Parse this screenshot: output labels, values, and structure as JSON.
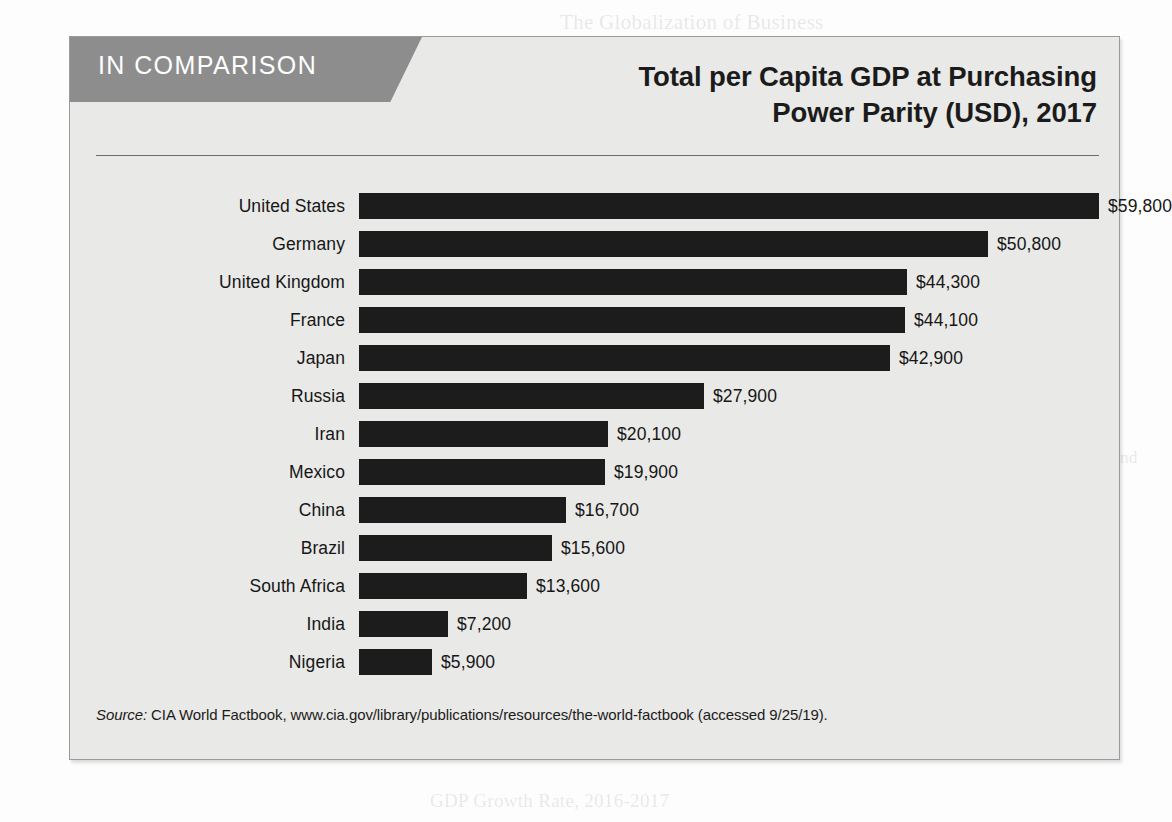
{
  "banner": {
    "label": "IN COMPARISON"
  },
  "title": {
    "line1": "Total per Capita GDP at Purchasing",
    "line2": "Power Parity (USD), 2017"
  },
  "source": {
    "prefix": "Source:",
    "text": "CIA World Factbook, www.cia.gov/library/publications/resources/the-world-factbook (accessed 9/25/19)."
  },
  "colors": {
    "panel_background": "#e9e9e7",
    "panel_border": "#9b9b9b",
    "banner": "#8d8d8d",
    "bar": "#1c1c1c",
    "text": "#161616",
    "rule": "#6d6d6d"
  },
  "bleed_text": {
    "top_right": "The Globalization of Business",
    "line_a": "determined solely by domestic factors. Politics, regulations,",
    "line_b": "and technologies all play a role in the shape of business",
    "line_c": "worldwide. Global business is affected by competing forces",
    "line_d": "that push toward greater integration as well as those that",
    "line_e": "resist it. Companies must be able to recognize and navigate",
    "line_f": "these shifting currents to succeed in international markets.",
    "line_g": "It is not easy to predict the future direction of the global economy",
    "line_h": "and currents of trade. Some observers argue that the recent upturn in",
    "line_i": "the anti-globalist or globalist politics in many countries, includes the",
    "line_j": "example of the United States, may not impede the relentless pace of",
    "line_k": "globalization supported by the growth of digital technologies, rising",
    "line_l": "trade agreements such as the promoted by the World Trade Organization and",
    "line_m": "because of the need to remain competitive.",
    "footer": "GDP Growth Rate, 2016-2017"
  },
  "chart_data": {
    "type": "bar",
    "orientation": "horizontal",
    "title": "Total per Capita GDP at Purchasing Power Parity (USD), 2017",
    "xlabel": "",
    "ylabel": "",
    "grid": false,
    "legend": false,
    "value_prefix": "$",
    "xlim": [
      0,
      59800
    ],
    "categories": [
      "United States",
      "Germany",
      "United Kingdom",
      "France",
      "Japan",
      "Russia",
      "Iran",
      "Mexico",
      "China",
      "Brazil",
      "South Africa",
      "India",
      "Nigeria"
    ],
    "values": [
      59800,
      50800,
      44300,
      44100,
      42900,
      27900,
      20100,
      19900,
      16700,
      15600,
      13600,
      7200,
      5900
    ],
    "value_labels": [
      "$59,800",
      "$50,800",
      "$44,300",
      "$44,100",
      "$42,900",
      "$27,900",
      "$20,100",
      "$19,900",
      "$16,700",
      "$15,600",
      "$13,600",
      "$7,200",
      "$5,900"
    ]
  }
}
